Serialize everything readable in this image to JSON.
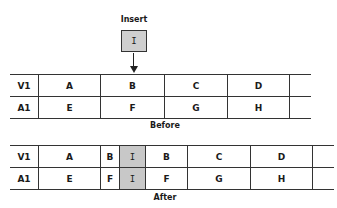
{
  "insert": {
    "label": "Insert",
    "value": "I"
  },
  "before": {
    "caption": "Before",
    "rows": [
      {
        "header": "V1",
        "cells": [
          "A",
          "B",
          "C",
          "D",
          ""
        ]
      },
      {
        "header": "A1",
        "cells": [
          "E",
          "F",
          "G",
          "H",
          ""
        ]
      }
    ]
  },
  "after": {
    "caption": "After",
    "rows": [
      {
        "header": "V1",
        "cells": [
          "A",
          "B",
          "I",
          "B",
          "C",
          "D",
          ""
        ]
      },
      {
        "header": "A1",
        "cells": [
          "E",
          "F",
          "I",
          "F",
          "G",
          "H",
          ""
        ]
      }
    ]
  },
  "colors": {
    "inserted_fill": "#c8c8c8",
    "line": "#333333"
  }
}
